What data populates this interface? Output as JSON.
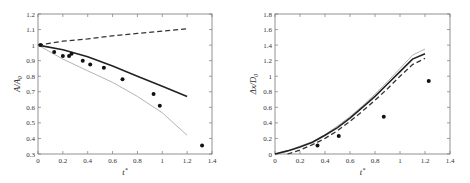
{
  "chart_data": [
    {
      "type": "line",
      "title": "",
      "xlabel": "t*",
      "ylabel": "A/A0",
      "xlim": [
        0,
        1.4
      ],
      "ylim": [
        0.3,
        1.2
      ],
      "xticks": [
        "0",
        "0.2",
        "0.4",
        "0.6",
        "0.8",
        "1",
        "1.2",
        "1.4"
      ],
      "yticks": [
        "0.3",
        "0.4",
        "0.5",
        "0.6",
        "0.7",
        "0.8",
        "0.9",
        "1",
        "1.1",
        "1.2"
      ],
      "grid": false,
      "legend": null,
      "series": [
        {
          "name": "dashed",
          "style": "dashed",
          "color": "#333333",
          "x": [
            0,
            0.2,
            0.4,
            0.6,
            0.8,
            1.0,
            1.2
          ],
          "y": [
            1.0,
            1.025,
            1.04,
            1.06,
            1.075,
            1.09,
            1.105
          ]
        },
        {
          "name": "solid",
          "style": "solid",
          "color": "#222222",
          "x": [
            0,
            0.2,
            0.4,
            0.6,
            0.8,
            1.0,
            1.2
          ],
          "y": [
            1.0,
            0.97,
            0.925,
            0.865,
            0.8,
            0.735,
            0.67
          ]
        },
        {
          "name": "light",
          "style": "solid-light",
          "color": "#aaaaaa",
          "x": [
            0,
            0.2,
            0.4,
            0.6,
            0.8,
            1.0,
            1.2
          ],
          "y": [
            1.0,
            0.91,
            0.835,
            0.76,
            0.67,
            0.565,
            0.42
          ]
        },
        {
          "name": "experiment",
          "style": "markers",
          "color": "#111111",
          "x": [
            0.02,
            0.13,
            0.2,
            0.25,
            0.27,
            0.36,
            0.42,
            0.53,
            0.68,
            0.93,
            0.98,
            1.32
          ],
          "y": [
            1.0,
            0.955,
            0.93,
            0.93,
            0.945,
            0.9,
            0.875,
            0.855,
            0.78,
            0.685,
            0.61,
            0.355
          ]
        }
      ]
    },
    {
      "type": "line",
      "title": "",
      "xlabel": "t*",
      "ylabel": "Δx/D0",
      "xlim": [
        0,
        1.4
      ],
      "ylim": [
        0,
        1.8
      ],
      "xticks": [
        "0",
        "0.2",
        "0.4",
        "0.6",
        "0.8",
        "1",
        "1.2",
        "1.4"
      ],
      "yticks": [
        "0",
        "0.2",
        "0.4",
        "0.6",
        "0.8",
        "1",
        "1.2",
        "1.4",
        "1.6",
        "1.8"
      ],
      "grid": false,
      "legend": null,
      "series": [
        {
          "name": "light",
          "style": "solid-light",
          "color": "#aaaaaa",
          "x": [
            0,
            0.1,
            0.2,
            0.3,
            0.4,
            0.5,
            0.6,
            0.7,
            0.8,
            0.9,
            1.0,
            1.1,
            1.2
          ],
          "y": [
            0,
            0.04,
            0.1,
            0.16,
            0.25,
            0.36,
            0.48,
            0.62,
            0.77,
            0.93,
            1.1,
            1.27,
            1.35
          ]
        },
        {
          "name": "solid",
          "style": "solid",
          "color": "#222222",
          "x": [
            0,
            0.1,
            0.2,
            0.3,
            0.4,
            0.5,
            0.6,
            0.7,
            0.8,
            0.9,
            1.0,
            1.1,
            1.2
          ],
          "y": [
            0,
            0.04,
            0.09,
            0.15,
            0.24,
            0.34,
            0.46,
            0.6,
            0.74,
            0.9,
            1.06,
            1.22,
            1.29
          ]
        },
        {
          "name": "dashed",
          "style": "dashed",
          "color": "#333333",
          "x": [
            0.1,
            0.2,
            0.3,
            0.4,
            0.5,
            0.6,
            0.7,
            0.8,
            0.9,
            1.0,
            1.1,
            1.2
          ],
          "y": [
            0.0,
            0.05,
            0.12,
            0.2,
            0.3,
            0.42,
            0.55,
            0.69,
            0.84,
            1.0,
            1.15,
            1.23
          ]
        },
        {
          "name": "experiment",
          "style": "markers",
          "color": "#111111",
          "x": [
            0.34,
            0.51,
            0.87,
            1.23
          ],
          "y": [
            0.11,
            0.23,
            0.48,
            0.94
          ]
        }
      ]
    }
  ],
  "plots": [
    {
      "ylabel_main": "A",
      "ylabel_sep": "/",
      "ylabel_sym": "A",
      "ylabel_sub": "0",
      "xlabel_main": "t",
      "xlabel_sup": "*"
    },
    {
      "ylabel_main": "Δx",
      "ylabel_sep": "/",
      "ylabel_sym": "D",
      "ylabel_sub": "0",
      "xlabel_main": "t",
      "xlabel_sup": "*"
    }
  ]
}
